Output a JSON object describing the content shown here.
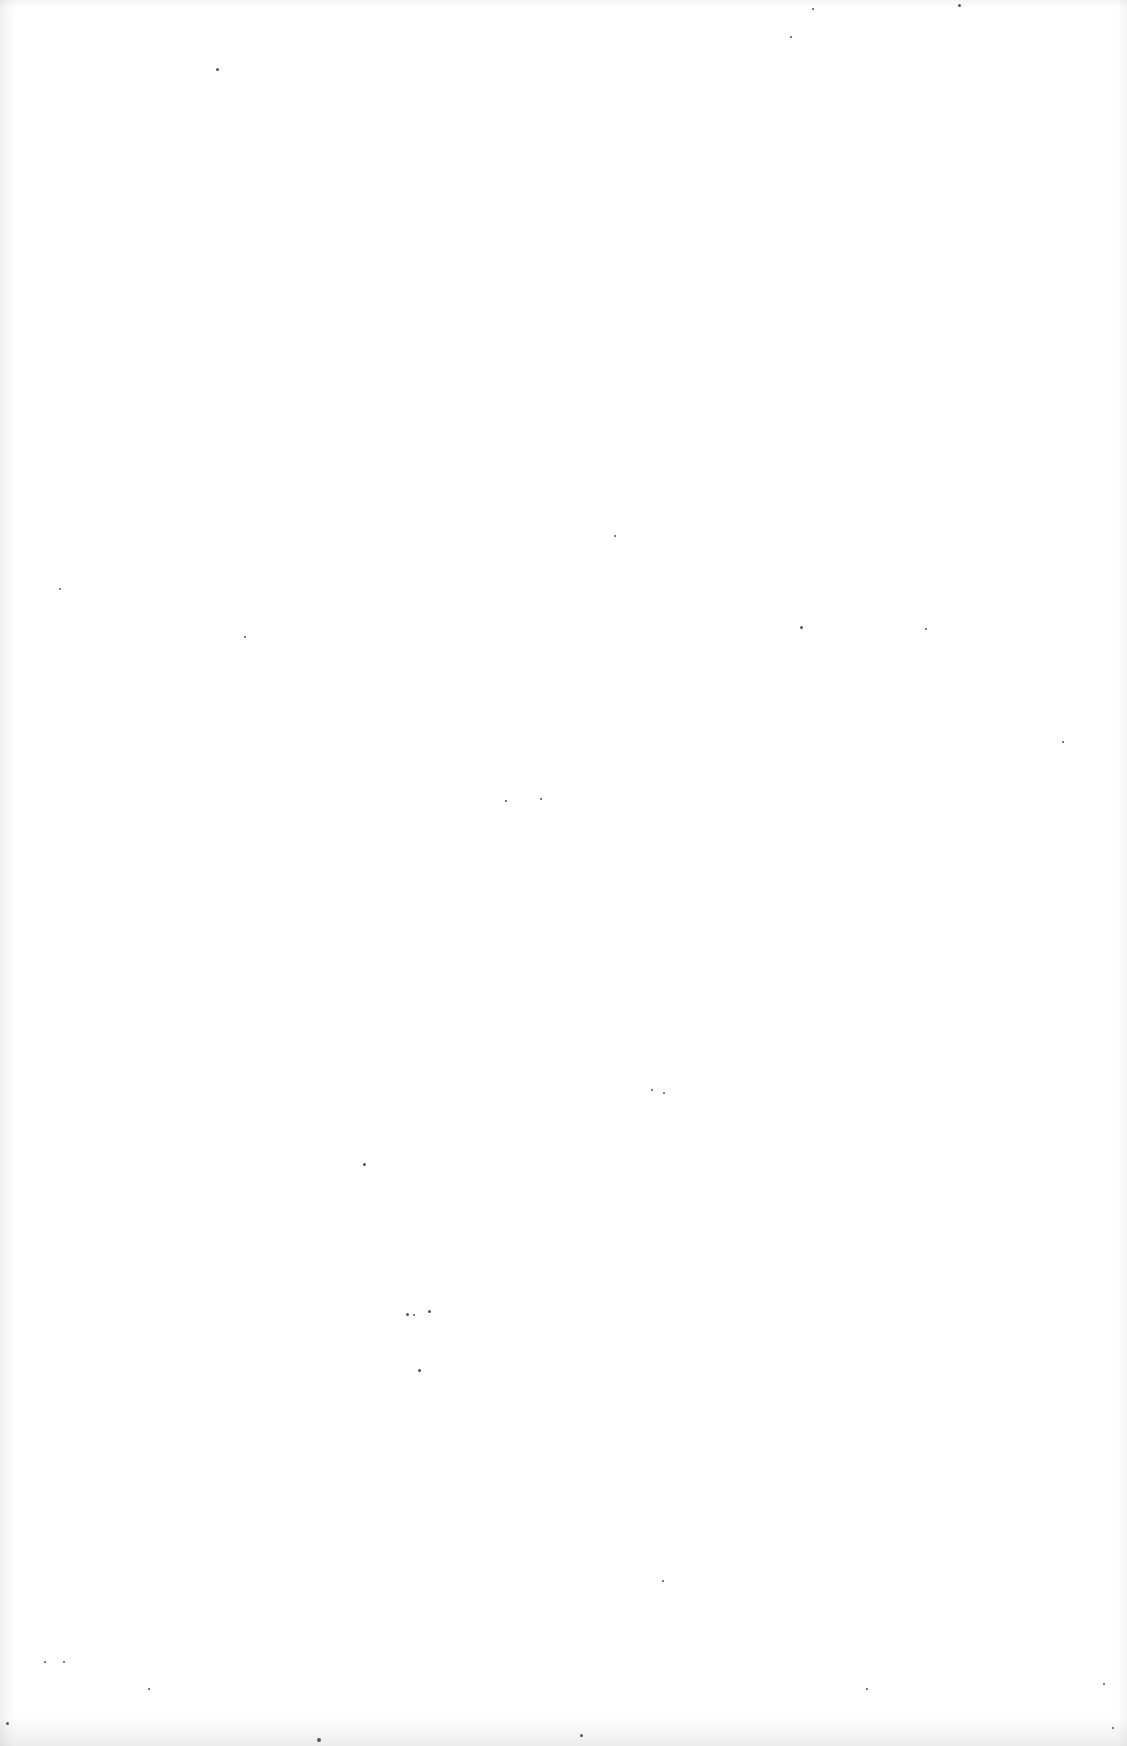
{
  "page": {
    "type": "blank-scanned-page",
    "background_color": "#ffffff",
    "speck_color": "#555555",
    "specks": [
      {
        "x": 216,
        "y": 68,
        "s": 3
      },
      {
        "x": 790,
        "y": 36,
        "s": 2
      },
      {
        "x": 812,
        "y": 8,
        "s": 2
      },
      {
        "x": 958,
        "y": 4,
        "s": 3
      },
      {
        "x": 59,
        "y": 588,
        "s": 2
      },
      {
        "x": 244,
        "y": 636,
        "s": 2
      },
      {
        "x": 614,
        "y": 535,
        "s": 2
      },
      {
        "x": 800,
        "y": 626,
        "s": 3
      },
      {
        "x": 925,
        "y": 628,
        "s": 2
      },
      {
        "x": 1062,
        "y": 741,
        "s": 2
      },
      {
        "x": 505,
        "y": 800,
        "s": 2
      },
      {
        "x": 540,
        "y": 798,
        "s": 2
      },
      {
        "x": 651,
        "y": 1089,
        "s": 2
      },
      {
        "x": 663,
        "y": 1092,
        "s": 2
      },
      {
        "x": 363,
        "y": 1163,
        "s": 3
      },
      {
        "x": 406,
        "y": 1313,
        "s": 3
      },
      {
        "x": 413,
        "y": 1314,
        "s": 2
      },
      {
        "x": 428,
        "y": 1310,
        "s": 3
      },
      {
        "x": 418,
        "y": 1369,
        "s": 3
      },
      {
        "x": 662,
        "y": 1580,
        "s": 2
      },
      {
        "x": 44,
        "y": 1661,
        "s": 2
      },
      {
        "x": 63,
        "y": 1661,
        "s": 2
      },
      {
        "x": 6,
        "y": 1722,
        "s": 3
      },
      {
        "x": 148,
        "y": 1688,
        "s": 2
      },
      {
        "x": 317,
        "y": 1738,
        "s": 4
      },
      {
        "x": 580,
        "y": 1734,
        "s": 3
      },
      {
        "x": 866,
        "y": 1688,
        "s": 2
      },
      {
        "x": 1103,
        "y": 1683,
        "s": 2
      },
      {
        "x": 1112,
        "y": 1727,
        "s": 2
      }
    ]
  }
}
